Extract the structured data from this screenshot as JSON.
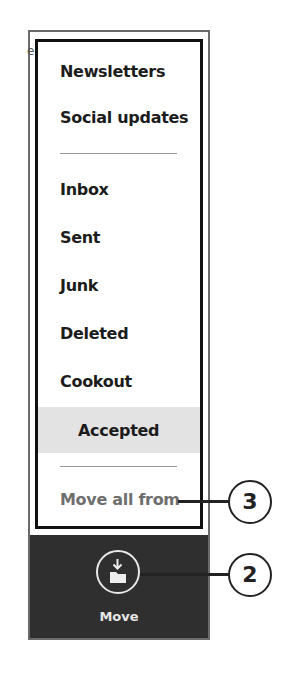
{
  "menu": {
    "items": [
      {
        "label": "Newsletters"
      },
      {
        "label": "Social updates"
      },
      {
        "label": "Inbox"
      },
      {
        "label": "Sent"
      },
      {
        "label": "Junk"
      },
      {
        "label": "Deleted"
      },
      {
        "label": "Cookout"
      },
      {
        "label": "Accepted",
        "selected": true
      }
    ],
    "move_all_label": "Move all from"
  },
  "appbar": {
    "move_label": "Move",
    "move_icon": "move-to-folder-icon"
  },
  "callouts": {
    "move_all": "3",
    "move_button": "2"
  },
  "partial_text": "e",
  "colors": {
    "appbar_bg": "#2f2f2f",
    "selected_bg": "#e3e3e3",
    "muted_text": "#6e6e6e"
  }
}
